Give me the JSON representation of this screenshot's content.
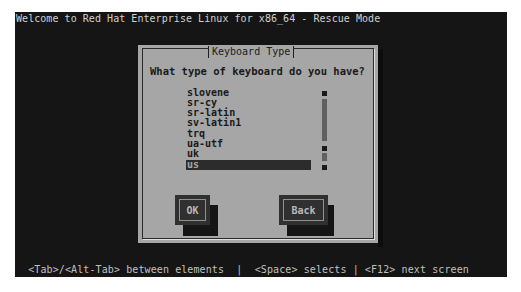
{
  "screen": {
    "title": "Welcome to Red Hat Enterprise Linux for x86_64 - Rescue Mode",
    "status_bar": "  <Tab>/<Alt-Tab> between elements  |  <Space> selects | <F12> next screen"
  },
  "dialog": {
    "title": "Keyboard Type",
    "prompt": "What type of keyboard do you have?",
    "list": {
      "items": [
        "slovene",
        "sr-cy",
        "sr-latin",
        "sv-latin1",
        "trq",
        "ua-utf",
        "uk",
        "us"
      ],
      "selected": "us"
    },
    "buttons": {
      "ok_label": "OK",
      "back_label": "Back"
    }
  },
  "colors": {
    "screen_bg": "#151515",
    "dialog_bg": "#a6a6a6",
    "selection_bg": "#2c2c2c",
    "button_bg": "#303030"
  }
}
